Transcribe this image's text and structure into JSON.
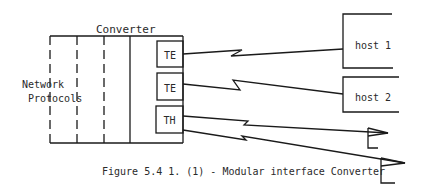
{
  "diagram": {
    "converter_label": "Converter",
    "network_label_line1": "Network",
    "network_label_line2": "Protocols",
    "modules": [
      {
        "label": "TE"
      },
      {
        "label": "TE"
      },
      {
        "label": "TH"
      }
    ],
    "hosts": [
      {
        "label": "host 1"
      },
      {
        "label": "host 2"
      }
    ],
    "caption": "Figure 5.4 1. (1) - Modular interface Converter",
    "line_color": "#1a1a1a"
  }
}
